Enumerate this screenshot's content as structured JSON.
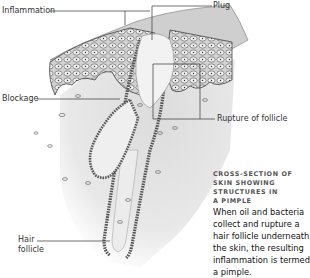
{
  "figure": {
    "labels": {
      "inflammation": "Inflammation",
      "plug": "Plug",
      "blockage": "Blockage",
      "rupture": "Rupture of follicle",
      "hair_follicle_1": "Hair",
      "hair_follicle_2": "follicle"
    },
    "caption": {
      "title_lines": [
        "Cross-section of",
        "skin showing",
        "structures in",
        "a pimple"
      ],
      "body_lines": [
        "When oil and bacteria",
        "collect and rupture a",
        "hair follicle underneath",
        "the skin, the resulting",
        "inflammation is termed",
        "a pimple."
      ]
    },
    "colors": {
      "dermis": "#e4e4e4",
      "epidermis": "#bfbfbf",
      "cell_outline": "#555555",
      "caption_title": "#555555",
      "caption_body": "#111111",
      "leader_line": "#333333"
    }
  }
}
